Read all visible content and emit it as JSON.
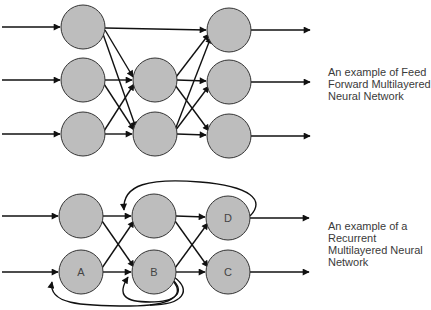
{
  "diagrams": [
    {
      "id": "feedforward",
      "caption": [
        "An example of Feed",
        "Forward Multilayered",
        "Neural Network"
      ],
      "nodes": [
        {
          "id": "f1a",
          "layer": 1,
          "label": ""
        },
        {
          "id": "f1b",
          "layer": 1,
          "label": ""
        },
        {
          "id": "f1c",
          "layer": 1,
          "label": ""
        },
        {
          "id": "f2a",
          "layer": 2,
          "label": ""
        },
        {
          "id": "f2b",
          "layer": 2,
          "label": ""
        },
        {
          "id": "f3a",
          "layer": 3,
          "label": ""
        },
        {
          "id": "f3b",
          "layer": 3,
          "label": ""
        },
        {
          "id": "f3c",
          "layer": 3,
          "label": ""
        }
      ]
    },
    {
      "id": "recurrent",
      "caption": [
        "An example of a",
        "Recurrent",
        "Multilayered Neural",
        "Network"
      ],
      "nodes": [
        {
          "id": "r1a",
          "layer": 1,
          "label": ""
        },
        {
          "id": "r1b",
          "layer": 1,
          "label": "A"
        },
        {
          "id": "r2a",
          "layer": 2,
          "label": ""
        },
        {
          "id": "r2b",
          "layer": 2,
          "label": "B"
        },
        {
          "id": "r3a",
          "layer": 3,
          "label": "D"
        },
        {
          "id": "r3b",
          "layer": 3,
          "label": "C"
        }
      ]
    }
  ],
  "colors": {
    "node_fill": "#bdbdbd",
    "node_stroke": "#333333",
    "edge": "#111111",
    "text": "#3a3a3a"
  }
}
